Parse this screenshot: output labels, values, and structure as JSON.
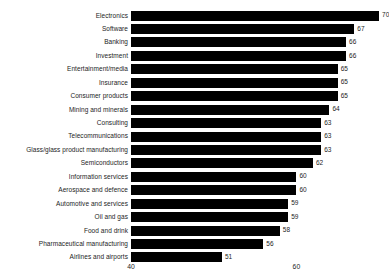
{
  "chart_data": {
    "type": "bar",
    "orientation": "horizontal",
    "title": "",
    "subtitle": "",
    "xlabel": "",
    "ylabel": "",
    "grid": false,
    "legend": false,
    "xlim": [
      40,
      72
    ],
    "axis_baseline": 40,
    "xticks": [
      40,
      60
    ],
    "xtick_labels": [
      "40",
      "60"
    ],
    "bar_color": "#000000",
    "background_color": "#ffffff",
    "text_color": "#1c1c1c",
    "categories": [
      "Electronics",
      "Software",
      "Banking",
      "Investment",
      "Entertainment/media",
      "Insurance",
      "Consumer products",
      "Mining and minerals",
      "Consulting",
      "Telecommunications",
      "Glass/glass product manufacturing",
      "Semiconductors",
      "Information services",
      "Aerospace and defence",
      "Automotive and services",
      "Oil and gas",
      "Food and drink",
      "Pharmaceutical manufacturing",
      "Airlines and airports"
    ],
    "values": [
      70,
      67,
      66,
      66,
      65,
      65,
      65,
      64,
      63,
      63,
      63,
      62,
      60,
      60,
      59,
      59,
      58,
      56,
      51
    ],
    "value_labels": [
      "70",
      "67",
      "66",
      "66",
      "65",
      "65",
      "65",
      "64",
      "63",
      "63",
      "63",
      "62",
      "60",
      "60",
      "59",
      "59",
      "58",
      "56",
      "51"
    ]
  }
}
